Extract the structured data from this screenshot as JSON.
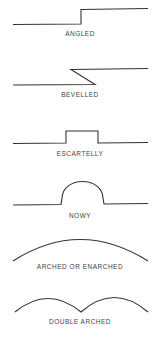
{
  "diagram": {
    "stroke_color": "#333333",
    "text_color": "#444444",
    "items": [
      {
        "label": "ANGLED",
        "shape": "step up (angled line)"
      },
      {
        "label": "BEVELLED",
        "shape": "z-shaped bevelled line"
      },
      {
        "label": "ESCARTELLY",
        "shape": "rectangular raised notch"
      },
      {
        "label": "NOWY",
        "shape": "semicircular raised bump"
      },
      {
        "label": "ARCHED OR ENARCHED",
        "shape": "single shallow arc"
      },
      {
        "label": "DOUBLE ARCHED",
        "shape": "two joined arcs"
      }
    ]
  }
}
